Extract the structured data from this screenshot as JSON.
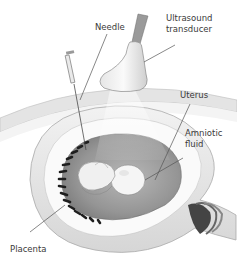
{
  "diagram": {
    "labels": {
      "needle": "Needle",
      "transducer_line1": "Ultrasound",
      "transducer_line2": "transducer",
      "uterus": "Uterus",
      "amniotic_line1": "Amniotic",
      "amniotic_line2": "fluid",
      "placenta": "Placenta"
    },
    "colors": {
      "background": "#ffffff",
      "uterus_wall": "#ececec",
      "uterus_shadow": "#c8c8c8",
      "amniotic_fluid": "#9a9a9a",
      "fetus": "#f4f4f4",
      "placenta": "#1e1e1e",
      "leader_line": "#555555",
      "text": "#3a3a3a"
    }
  }
}
